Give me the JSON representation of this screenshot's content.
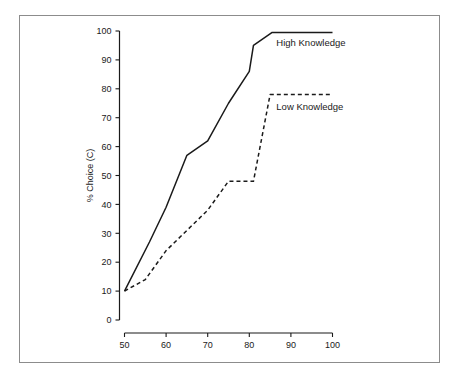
{
  "figure": {
    "background_color": "#ffffff",
    "frame_color": "#8c8c8c",
    "ink_color": "#1a1a1a"
  },
  "chart_data": {
    "type": "line",
    "title": "",
    "subtitle": "",
    "xlabel": "",
    "ylabel": "% Choice (C)",
    "xlim": [
      50,
      100
    ],
    "ylim": [
      0,
      100
    ],
    "xticks": [
      50,
      60,
      70,
      80,
      90,
      100
    ],
    "yticks": [
      0,
      10,
      20,
      30,
      40,
      50,
      60,
      70,
      80,
      90,
      100
    ],
    "xtick_labels": [
      "50",
      "60",
      "70",
      "80",
      "90",
      "100"
    ],
    "ytick_labels": [
      "0",
      "10",
      "20",
      "30",
      "40",
      "50",
      "60",
      "70",
      "80",
      "90",
      "100"
    ],
    "grid": false,
    "legend_position": "inline-annotation",
    "series": [
      {
        "name": "High Knowledge",
        "style": "solid",
        "color": "#1a1a1a",
        "label_x": 86.5,
        "label_y": 96,
        "points": [
          {
            "x": 50,
            "y": 10
          },
          {
            "x": 56,
            "y": 27
          },
          {
            "x": 60,
            "y": 39
          },
          {
            "x": 65,
            "y": 57
          },
          {
            "x": 70,
            "y": 62
          },
          {
            "x": 75,
            "y": 75
          },
          {
            "x": 80,
            "y": 86
          },
          {
            "x": 81,
            "y": 95
          },
          {
            "x": 85.5,
            "y": 99.5
          },
          {
            "x": 100,
            "y": 99.5
          }
        ]
      },
      {
        "name": "Low Knowledge",
        "style": "dashed",
        "color": "#1a1a1a",
        "label_x": 86.5,
        "label_y": 74,
        "points": [
          {
            "x": 50,
            "y": 10
          },
          {
            "x": 55,
            "y": 14
          },
          {
            "x": 60,
            "y": 24
          },
          {
            "x": 65,
            "y": 31
          },
          {
            "x": 70,
            "y": 38
          },
          {
            "x": 75,
            "y": 48
          },
          {
            "x": 81,
            "y": 48
          },
          {
            "x": 85,
            "y": 78
          },
          {
            "x": 100,
            "y": 78
          }
        ]
      }
    ],
    "annotations": [
      {
        "text": "High Knowledge",
        "x": 86.5,
        "y": 96
      },
      {
        "text": "Low Knowledge",
        "x": 86.5,
        "y": 74
      }
    ]
  }
}
